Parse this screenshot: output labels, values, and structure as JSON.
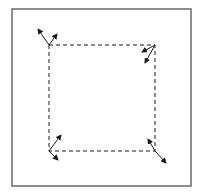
{
  "diagram": {
    "title": "",
    "background": "#ffffff",
    "stroke_color": "#1a1a1a",
    "frame": {
      "x": 12,
      "y": 9,
      "width": 179,
      "height": 177,
      "color": "#6a6a6a"
    },
    "dashed_square": {
      "corners": [
        {
          "name": "top-left",
          "x": 49,
          "y": 45
        },
        {
          "name": "top-right",
          "x": 155,
          "y": 45
        },
        {
          "name": "bottom-right",
          "x": 155,
          "y": 151
        },
        {
          "name": "bottom-left",
          "x": 49,
          "y": 151
        }
      ],
      "dash": "4,3"
    },
    "arrows": [
      {
        "corner": "top-left",
        "from": [
          49,
          45
        ],
        "to": [
          38,
          29
        ]
      },
      {
        "corner": "top-left",
        "from": [
          49,
          45
        ],
        "to": [
          57,
          34
        ]
      },
      {
        "corner": "top-right",
        "from": [
          155,
          45
        ],
        "to": [
          142,
          52
        ]
      },
      {
        "corner": "top-right",
        "from": [
          155,
          45
        ],
        "to": [
          145,
          63
        ]
      },
      {
        "corner": "bottom-left",
        "from": [
          49,
          151
        ],
        "to": [
          61,
          135
        ]
      },
      {
        "corner": "bottom-left",
        "from": [
          49,
          151
        ],
        "to": [
          58,
          160
        ]
      },
      {
        "corner": "bottom-right",
        "from": [
          155,
          151
        ],
        "to": [
          148,
          139
        ]
      },
      {
        "corner": "bottom-right",
        "from": [
          155,
          151
        ],
        "to": [
          166,
          163
        ]
      }
    ]
  }
}
